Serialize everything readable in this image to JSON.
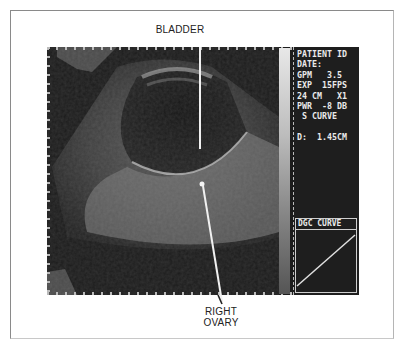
{
  "annotations": {
    "top_label": "BLADDER",
    "bottom_label_line1": "RIGHT",
    "bottom_label_line2": "OVARY"
  },
  "display_panel": {
    "lines": [
      "PATIENT ID",
      "DATE:",
      "GPM   3.5",
      "EXP  15FPS",
      "24 CM   X1",
      "PWR  -8 DB",
      " S CURVE",
      "",
      "D:  1.45CM"
    ],
    "dgc_title": "DGC CURVE"
  },
  "colors": {
    "screen_bg": "#1c1c1c",
    "text": "#eaeaea",
    "label_text": "#222222"
  }
}
